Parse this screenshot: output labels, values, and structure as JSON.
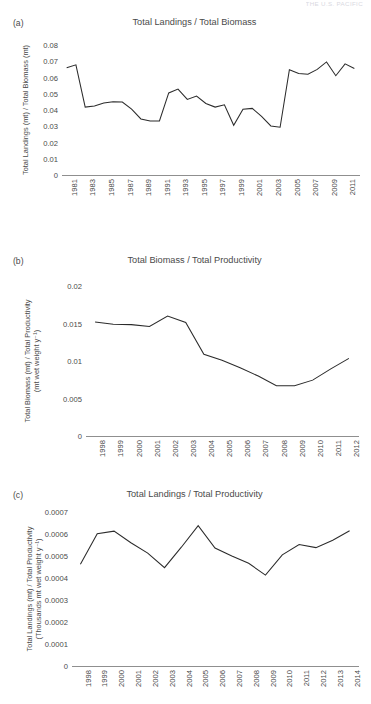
{
  "running_head": "THE U.S. PACIFIC",
  "panels": [
    {
      "id": "a",
      "label": "(a)",
      "title": "Total Landings / Total Biomass",
      "ylabel_line1": "Total Landings (mt) / Total Biomass (mt)",
      "ylabel_line2": ""
    },
    {
      "id": "b",
      "label": "(b)",
      "title": "Total Biomass / Total Productivity",
      "ylabel_line1": "Total Biomass (mt) / Total Productivity",
      "ylabel_line2": "(mt wet weight y⁻¹)"
    },
    {
      "id": "c",
      "label": "(c)",
      "title": "Total Landings / Total Productivity",
      "ylabel_line1": "Total Landings (mt) / Total Productivity",
      "ylabel_line2": "(Thousands mt wet weight y⁻¹)"
    }
  ],
  "chart_data": [
    {
      "type": "line",
      "panel": "a",
      "title": "Total Landings / Total Biomass",
      "xlabel": "",
      "ylabel": "Total Landings (mt) / Total Biomass (mt)",
      "ylim": [
        0,
        0.08
      ],
      "yticks": [
        0,
        0.01,
        0.02,
        0.03,
        0.04,
        0.05,
        0.06,
        0.07,
        0.08
      ],
      "ytick_labels": [
        "0",
        "0.01",
        "0.02",
        "0.03",
        "0.04",
        "0.05",
        "0.06",
        "0.07",
        "0.08"
      ],
      "xlim": [
        1981,
        2012
      ],
      "xticks": [
        1981,
        1983,
        1985,
        1987,
        1989,
        1991,
        1993,
        1995,
        1997,
        1999,
        2001,
        2003,
        2005,
        2007,
        2009,
        2011
      ],
      "xtick_labels": [
        "1981",
        "1983",
        "1985",
        "1987",
        "1989",
        "1991",
        "1993",
        "1995",
        "1997",
        "1999",
        "2001",
        "2003",
        "2005",
        "2007",
        "2009",
        "2011"
      ],
      "grid": false,
      "legend": "none",
      "x": [
        1981,
        1982,
        1983,
        1984,
        1985,
        1986,
        1987,
        1988,
        1989,
        1990,
        1991,
        1992,
        1993,
        1994,
        1995,
        1996,
        1997,
        1998,
        1999,
        2000,
        2001,
        2002,
        2003,
        2004,
        2005,
        2006,
        2007,
        2008,
        2009,
        2010,
        2011,
        2012
      ],
      "values": [
        0.066,
        0.0678,
        0.0418,
        0.0425,
        0.0443,
        0.0451,
        0.0449,
        0.0405,
        0.0345,
        0.0332,
        0.0333,
        0.0505,
        0.0529,
        0.0465,
        0.0486,
        0.044,
        0.0418,
        0.0432,
        0.0306,
        0.0404,
        0.041,
        0.0361,
        0.0302,
        0.0294,
        0.0648,
        0.0625,
        0.062,
        0.065,
        0.0696,
        0.0611,
        0.0684,
        0.0655,
        0.0512
      ]
    },
    {
      "type": "line",
      "panel": "b",
      "title": "Total Biomass / Total Productivity",
      "xlabel": "",
      "ylabel": "Total Biomass (mt) / Total Productivity (mt wet weight y⁻¹)",
      "ylim": [
        0,
        0.02
      ],
      "yticks": [
        0,
        0.005,
        0.01,
        0.015,
        0.02
      ],
      "ytick_labels": [
        "0",
        "0.005",
        "0.01",
        "0.015",
        "0.02"
      ],
      "xlim": [
        1998,
        2012
      ],
      "xticks": [
        1998,
        1999,
        2000,
        2001,
        2002,
        2003,
        2004,
        2005,
        2006,
        2007,
        2008,
        2009,
        2010,
        2011,
        2012
      ],
      "xtick_labels": [
        "1998",
        "1999",
        "2000",
        "2001",
        "2002",
        "2003",
        "2004",
        "2005",
        "2006",
        "2007",
        "2008",
        "2009",
        "2010",
        "2011",
        "2012"
      ],
      "grid": false,
      "legend": "none",
      "x": [
        1998,
        1999,
        2000,
        2001,
        2002,
        2003,
        2004,
        2005,
        2006,
        2007,
        2008,
        2009,
        2010,
        2011,
        2012
      ],
      "values": [
        0.0152,
        0.0149,
        0.01485,
        0.0146,
        0.016,
        0.01515,
        0.0109,
        0.0101,
        0.0091,
        0.008,
        0.0067,
        0.0067,
        0.00745,
        0.00895,
        0.01035
      ]
    },
    {
      "type": "line",
      "panel": "c",
      "title": "Total Landings / Total Productivity",
      "xlabel": "",
      "ylabel": "Total Landings (mt) / Total Productivity (Thousands mt wet weight y⁻¹)",
      "ylim": [
        0,
        0.0007
      ],
      "yticks": [
        0,
        0.0001,
        0.0002,
        0.0003,
        0.0004,
        0.0005,
        0.0006,
        0.0007
      ],
      "ytick_labels": [
        "0",
        "0.0001",
        "0.0002",
        "0.0003",
        "0.0004",
        "0.0005",
        "0.0006",
        "0.0007"
      ],
      "xlim": [
        1998,
        2014
      ],
      "xticks": [
        1998,
        1999,
        2000,
        2001,
        2002,
        2003,
        2004,
        2005,
        2006,
        2007,
        2008,
        2009,
        2010,
        2011,
        2012,
        2013,
        2014
      ],
      "xtick_labels": [
        "1998",
        "1999",
        "2000",
        "2001",
        "2002",
        "2003",
        "2004",
        "2005",
        "2006",
        "2007",
        "2008",
        "2009",
        "2010",
        "2011",
        "2012",
        "2013",
        "2014"
      ],
      "grid": false,
      "legend": "none",
      "x": [
        1998,
        1999,
        2000,
        2001,
        2002,
        2003,
        2004,
        2005,
        2006,
        2007,
        2008,
        2009,
        2010,
        2011,
        2012,
        2013,
        2014
      ],
      "values": [
        0.000463,
        0.000601,
        0.000613,
        0.00056,
        0.000513,
        0.000447,
        0.00054,
        0.000638,
        0.000536,
        0.0005,
        0.000467,
        0.000413,
        0.000505,
        0.000552,
        0.000538,
        0.000572,
        0.000615
      ]
    }
  ]
}
